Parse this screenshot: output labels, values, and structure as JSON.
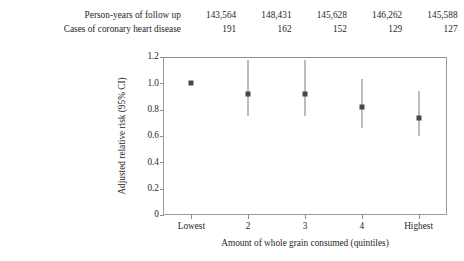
{
  "annotation_rows": [
    {
      "label": "Person-years of follow up",
      "values": [
        "143,564",
        "148,431",
        "145,628",
        "146,262",
        "145,588"
      ]
    },
    {
      "label": "Cases of coronary heart disease",
      "values": [
        "191",
        "162",
        "152",
        "129",
        "127"
      ]
    }
  ],
  "chart_data": {
    "type": "scatter",
    "title": "",
    "xlabel": "Amount of whole grain consumed (quintiles)",
    "ylabel": "Adjusted relative risk (95% CI)",
    "categories": [
      "Lowest",
      "2",
      "3",
      "4",
      "Highest"
    ],
    "yticklabels": [
      "0",
      "0.2",
      "0.4",
      "0.6",
      "0.8",
      "1.0",
      "1.2"
    ],
    "ytickvalues": [
      0,
      0.2,
      0.4,
      0.6,
      0.8,
      1.0,
      1.2
    ],
    "ylim": [
      0,
      1.2
    ],
    "grid": false,
    "legend": "none",
    "series": [
      {
        "name": "Adjusted relative risk",
        "values": [
          1.0,
          0.92,
          0.92,
          0.82,
          0.74
        ],
        "ci_lower": [
          null,
          0.75,
          0.75,
          0.66,
          0.6
        ],
        "ci_upper": [
          null,
          1.18,
          1.18,
          1.03,
          0.94
        ]
      }
    ],
    "marker_color": "#4a4745",
    "errorbar_color": "#7d7d7d",
    "axis_color": "#8e8e8e"
  }
}
